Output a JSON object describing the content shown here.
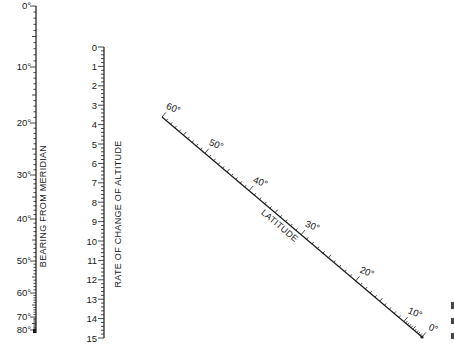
{
  "diagram": {
    "type": "nomogram",
    "scales": {
      "bearing": {
        "title": "BEARING FROM MERIDIAN",
        "unit": "°",
        "labels": [
          "0°",
          "10°",
          "20°",
          "30°",
          "40°",
          "50°",
          "60°",
          "70°",
          "80°"
        ],
        "values": [
          0,
          10,
          20,
          30,
          40,
          50,
          60,
          70,
          80
        ],
        "label_y": [
          6,
          67,
          123,
          175,
          219,
          261,
          293,
          317,
          330
        ]
      },
      "rate": {
        "title": "RATE OF CHANGE OF ALTITUDE",
        "labels": [
          "0",
          "1",
          "2",
          "3",
          "4",
          "5",
          "6",
          "7",
          "8",
          "9",
          "10",
          "11",
          "12",
          "13",
          "14",
          "15"
        ],
        "min": 0,
        "max": 15
      },
      "latitude": {
        "title": "LATITUDE",
        "unit": "°",
        "labels": [
          "60°",
          "50°",
          "40°",
          "30°",
          "20°",
          "10°",
          "0°"
        ],
        "values": [
          60,
          50,
          40,
          30,
          20,
          10,
          0
        ]
      }
    }
  }
}
